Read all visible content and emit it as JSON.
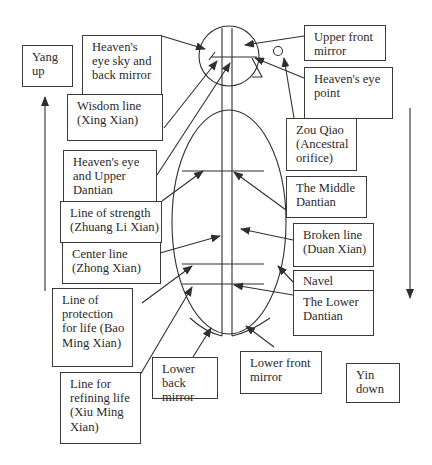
{
  "diagram": {
    "title": "",
    "colors": {
      "line": "#2f2f2f",
      "text": "#2a2a2a",
      "background": "#ffffff"
    },
    "labels": {
      "yang_up": "Yang\nup",
      "heavens_eye_sky": "Heaven's\neye sky and\nback mirror",
      "wisdom_line": "Wisdom line\n(Xing Xian)",
      "heavens_eye_upper_dantian": "Heaven's eye\nand Upper\nDantian",
      "line_of_strength": "Line of strength\n(Zhuang Li Xian)",
      "center_line": "Center line\n(Zhong Xian)",
      "line_of_protection": "Line of\nprotection\nfor life (Bao\nMing Xian)",
      "line_for_refining": "Line for\nrefining life\n(Xiu Ming\nXian)",
      "lower_back_mirror": "Lower back\nmirror",
      "lower_front_mirror": "Lower front\nmirror",
      "yin_down": "Yin\ndown",
      "upper_front_mirror": "Upper front\nmirror",
      "heavens_eye_point": "Heaven's eye\npoint",
      "zou_qiao": "Zou Qiao\n(Ancestral\norifice)",
      "middle_dantian": "The Middle\nDantian",
      "broken_line": "Broken line\n(Duan Xian)",
      "navel": "Navel",
      "lower_dantian": "The Lower\nDantian"
    },
    "nodes": [
      {
        "id": "head-circle",
        "shape": "circle",
        "semantic": "head"
      },
      {
        "id": "body-ellipse",
        "shape": "ellipse",
        "semantic": "torso"
      },
      {
        "id": "zou-qiao-circle",
        "shape": "small-circle",
        "semantic": "ancestral orifice point"
      },
      {
        "id": "nose-shape",
        "shape": "polyline",
        "semantic": "nose profile"
      }
    ],
    "arrows": [
      {
        "from": "heavens_eye_sky",
        "to": "head back"
      },
      {
        "from": "wisdom_line",
        "to": "head inner line"
      },
      {
        "from": "heavens_eye_upper_dantian",
        "to": "head center line"
      },
      {
        "from": "line_of_strength",
        "to": "upper body horizontal line"
      },
      {
        "from": "center_line",
        "to": "vertical center line"
      },
      {
        "from": "line_of_protection",
        "to": "middle horizontal line"
      },
      {
        "from": "line_for_refining",
        "to": "lower horizontal line"
      },
      {
        "from": "lower_back_mirror",
        "to": "bottom back curve"
      },
      {
        "from": "lower_front_mirror",
        "to": "bottom front curve"
      },
      {
        "from": "upper_front_mirror",
        "to": "head front"
      },
      {
        "from": "heavens_eye_point",
        "to": "head horizontal line"
      },
      {
        "from": "zou_qiao",
        "to": "small circle"
      },
      {
        "from": "middle_dantian",
        "to": "upper horizontal line right"
      },
      {
        "from": "broken_line",
        "to": "body interior"
      },
      {
        "from": "navel",
        "to": "body edge"
      },
      {
        "from": "lower_dantian",
        "to": "lower horizontal line right"
      },
      {
        "from": "yang_up",
        "direction": "up"
      },
      {
        "from": "yin_down",
        "direction": "down"
      }
    ]
  }
}
